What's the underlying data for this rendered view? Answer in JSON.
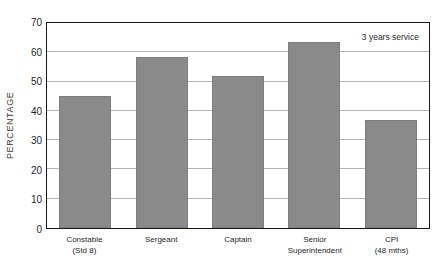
{
  "chart_data": {
    "type": "bar",
    "title": "",
    "subtitle": "",
    "xlabel": "",
    "ylabel": "PERCENTAGE",
    "ylim": [
      0,
      70
    ],
    "y_ticks": [
      70,
      60,
      50,
      40,
      30,
      20,
      10,
      0
    ],
    "grid": true,
    "legend_position": "none",
    "annotation": "3 years service",
    "categories": [
      "Constable",
      "Sergeant",
      "Captain",
      "Senior Superintendent",
      "CPI"
    ],
    "category_labels": [
      {
        "line1": "Constable",
        "line2": "(Std 8)"
      },
      {
        "line1": "Sergeant",
        "line2": ""
      },
      {
        "line1": "Captain",
        "line2": ""
      },
      {
        "line1": "Senior",
        "line2": "Superintendent"
      },
      {
        "line1": "CPI",
        "line2": "(48 mths)"
      }
    ],
    "values": [
      45,
      58.5,
      52,
      63.5,
      37
    ],
    "bar_color": "#8a8a8a",
    "axis_color": "#1a1a1a",
    "gridline_color": "#b4b4b4"
  }
}
